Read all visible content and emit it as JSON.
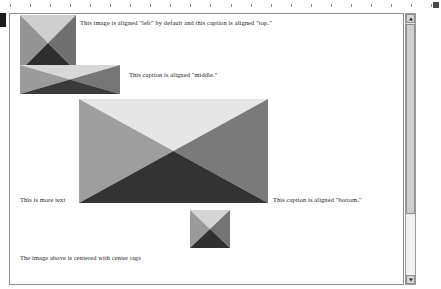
{
  "window": {
    "type": "word-processor-document-view",
    "background_color": "#ffffff",
    "page_border_color": "#8d8d8d"
  },
  "ruler": {
    "name": "horizontal-ruler",
    "tick_count": 22,
    "tick_color": "#8a8a8a",
    "end_marker": "right-indent-marker"
  },
  "document": {
    "captions": {
      "top": "This image is aligned \"left\" by default and this caption is aligned \"top.\"",
      "middle": "This caption is aligned \"middle.\"",
      "more_text": "This is more text",
      "bottom": "This caption is aligned \"bottom.\"",
      "center_note": "The image above is centered with center tags"
    },
    "images": [
      {
        "name": "bowtie-image-left",
        "alignment": "left",
        "caption_align": "top",
        "width": 56,
        "height": 56,
        "colors": {
          "top": "#cfcfcf",
          "left": "#949494",
          "right": "#707070",
          "bottom": "#2e2e2e"
        }
      },
      {
        "name": "bowtie-image-middle",
        "alignment": "left",
        "caption_align": "middle",
        "width": 100,
        "height": 29,
        "colors": {
          "top": "#d8d8d8",
          "left": "#9b9b9b",
          "right": "#767676",
          "bottom": "#3a3a3a"
        }
      },
      {
        "name": "bowtie-image-center",
        "alignment": "center",
        "caption_align": "bottom",
        "width": 189,
        "height": 104,
        "colors": {
          "top": "#e6e6e6",
          "left": "#9e9e9e",
          "right": "#7a7a7a",
          "bottom": "#333333"
        }
      },
      {
        "name": "bowtie-image-bottom",
        "alignment": "center",
        "caption_align": "none",
        "width": 40,
        "height": 38,
        "colors": {
          "top": "#d5d5d5",
          "left": "#9a9a9a",
          "right": "#747474",
          "bottom": "#303030"
        }
      }
    ]
  },
  "scrollbar": {
    "name": "vertical-scrollbar",
    "orientation": "vertical",
    "up_arrow": "scroll-up-icon",
    "down_arrow": "scroll-down-icon",
    "thumb_position": "top",
    "track_color": "#e9e9e9",
    "thumb_color": "#cfcfcf"
  }
}
